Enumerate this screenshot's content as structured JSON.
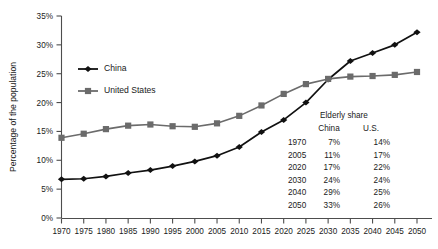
{
  "chart_data": {
    "type": "line",
    "title": "",
    "xlabel": "",
    "ylabel": "Percentage of the population",
    "x": [
      1970,
      1975,
      1980,
      1985,
      1990,
      1995,
      2000,
      2005,
      2010,
      2015,
      2020,
      2025,
      2030,
      2035,
      2040,
      2045,
      2050
    ],
    "xtick_labels": [
      "1970",
      "1975",
      "1980",
      "1985",
      "1990",
      "1995",
      "2000",
      "2005",
      "2010",
      "2015",
      "2020",
      "2025",
      "2030",
      "2035",
      "2040",
      "2045",
      "2050"
    ],
    "ytick_labels": [
      "0%",
      "5%",
      "10%",
      "15%",
      "20%",
      "25%",
      "30%",
      "35%"
    ],
    "ytick_values": [
      0,
      5,
      10,
      15,
      20,
      25,
      30,
      35
    ],
    "xlim": [
      1970,
      2050
    ],
    "ylim": [
      0,
      35
    ],
    "grid": false,
    "legend_position": "upper-left-inside",
    "series": [
      {
        "name": "China",
        "color": "#111111",
        "marker": "diamond",
        "values": [
          6.7,
          6.8,
          7.2,
          7.8,
          8.3,
          9.0,
          9.8,
          10.8,
          12.3,
          14.9,
          17.0,
          20.0,
          24.0,
          27.2,
          28.6,
          30.0,
          32.2
        ]
      },
      {
        "name": "United States",
        "color": "#6b6b6b",
        "marker": "square",
        "values": [
          13.9,
          14.6,
          15.4,
          16.0,
          16.2,
          15.9,
          15.8,
          16.4,
          17.7,
          19.5,
          21.5,
          23.2,
          24.1,
          24.5,
          24.6,
          24.8,
          25.3
        ]
      }
    ]
  },
  "legend": {
    "entries": [
      {
        "label": "China"
      },
      {
        "label": "United States"
      }
    ]
  },
  "inset_table": {
    "title": "Elderly share",
    "columns": [
      "China",
      "U.S."
    ],
    "rows": [
      {
        "year": "1970",
        "china": "7%",
        "us": "14%"
      },
      {
        "year": "2005",
        "china": "11%",
        "us": "17%"
      },
      {
        "year": "2020",
        "china": "17%",
        "us": "22%"
      },
      {
        "year": "2030",
        "china": "24%",
        "us": "24%"
      },
      {
        "year": "2040",
        "china": "29%",
        "us": "25%"
      },
      {
        "year": "2050",
        "china": "33%",
        "us": "26%"
      }
    ]
  }
}
